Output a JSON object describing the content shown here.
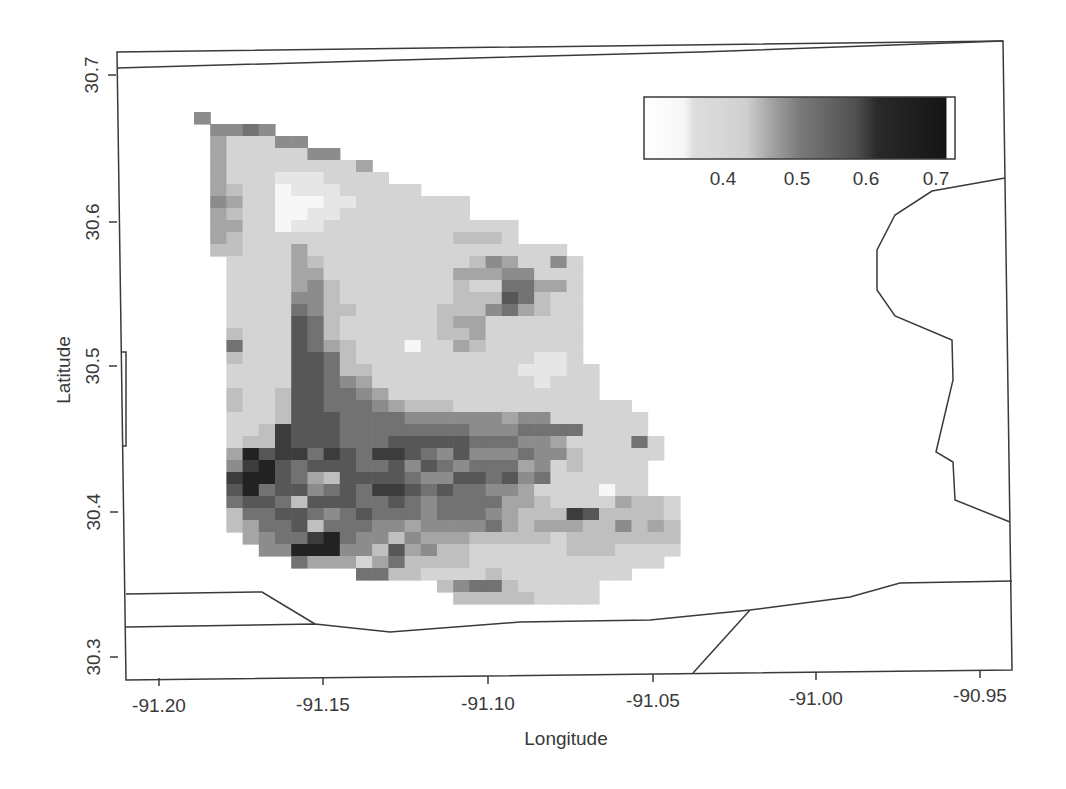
{
  "chart_data": {
    "type": "heatmap",
    "title": "",
    "xlabel": "Longitude",
    "ylabel": "Latitude",
    "xlim": [
      -91.21,
      -90.94
    ],
    "ylim": [
      30.29,
      30.71
    ],
    "x_ticks": [
      "-91.20",
      "-91.15",
      "-91.10",
      "-91.05",
      "-91.00",
      "-90.95"
    ],
    "y_ticks": [
      "30.3",
      "30.4",
      "30.5",
      "30.6",
      "30.7"
    ],
    "grid": false,
    "colorbar": {
      "position": "top-right inset",
      "range": [
        0.33,
        0.72
      ],
      "tick_labels": [
        "0.4",
        "0.5",
        "0.6",
        "0.7"
      ],
      "tick_values": [
        0.4,
        0.5,
        0.6,
        0.7
      ],
      "colormap": "grayscale (white = low, black = high)"
    },
    "value_levels": {
      "0": 0.34,
      "1": 0.38,
      "2": 0.41,
      "3": 0.44,
      "4": 0.48,
      "5": 0.52,
      "6": 0.56,
      "7": 0.6,
      "8": 0.64,
      "9": 0.68
    },
    "grid_origin_px": {
      "x": 194,
      "y": 112,
      "cell_w": 16.2,
      "cell_h": 12
    },
    "rows": [
      "5.......................................",
      ".5565...................................",
      ".422255.................................",
      ".42222255...............................",
      ".4222222224.............................",
      ".42221112222............................",
      ".4322011122222..........................",
      ".5422000112222222.......................",
      ".4322001122222222.......................",
      ".4422011222222222222....................",
      ".4322222222222223332....................",
      ".3322242222222222222222.................",
      "..2222432222222223542252................",
      "..2222442222222244455222................",
      "..2222453222222232266442................",
      "..2222553222222233376322................",
      "..2222653322222333564322................",
      "..2222763222222344222222................",
      "..3222763222222334222222................",
      "..6222764322202243222222................",
      "..3222776322222222222112................",
      "..22227763322222222211122...............",
      "..22227765422222222221222...............",
      "..32237766542222222222222...............",
      "..3223776665433322222222222.............",
      "..22237776666555555455222222............",
      "..22387776666666655566662222............",
      "..233877766677777666554222262...........",
      "..497886876887657555655322222...........",
      "..58976777667576566645232222............",
      "..89976437777655776756222222............",
      "..79677567688767665542222022............",
      "..6776377766765666644322224332..........",
      "..3667765676665666543338733332..........",
      "..3466736665545555643444335343..........",
      "...456689655354443333323333333..........",
      "....55999553745332222223332222..........",
      "......64442463333222222222222...........",
      "..........66332222322222222.............",
      "...............3566322222...............",
      "................333332222..............."
    ],
    "map_boundaries": [
      {
        "name": "top-boundary",
        "points": [
          [
            117,
            68
          ],
          [
            400,
            60
          ],
          [
            700,
            52
          ],
          [
            1003,
            41
          ]
        ]
      },
      {
        "name": "east-boundary",
        "points": [
          [
            1005,
            178
          ],
          [
            932,
            191
          ],
          [
            895,
            215
          ],
          [
            877,
            250
          ],
          [
            877,
            290
          ],
          [
            895,
            316
          ],
          [
            952,
            340
          ],
          [
            953,
            380
          ],
          [
            936,
            452
          ],
          [
            953,
            462
          ],
          [
            955,
            500
          ],
          [
            1010,
            522
          ]
        ]
      },
      {
        "name": "south-boundary-upper",
        "points": [
          [
            126,
            594
          ],
          [
            262,
            592
          ],
          [
            315,
            624
          ]
        ]
      },
      {
        "name": "south-boundary-lower",
        "points": [
          [
            126,
            627
          ],
          [
            315,
            624
          ],
          [
            390,
            632
          ],
          [
            520,
            622
          ],
          [
            650,
            620
          ],
          [
            750,
            610
          ],
          [
            850,
            597
          ],
          [
            900,
            583
          ],
          [
            1012,
            581
          ]
        ]
      },
      {
        "name": "southeast-diagonal",
        "points": [
          [
            750,
            610
          ],
          [
            693,
            673
          ]
        ]
      },
      {
        "name": "west-notch",
        "points": [
          [
            122,
            352
          ],
          [
            126,
            352
          ],
          [
            126,
            446
          ],
          [
            122,
            446
          ]
        ]
      }
    ]
  },
  "axes": {
    "x_title": "Longitude",
    "y_title": "Latitude",
    "x_tick_px": [
      159,
      323,
      488,
      653,
      816,
      980
    ],
    "y_tick_px": [
      657,
      512,
      366,
      222,
      75
    ]
  },
  "colors": {
    "axis": "#3a3a3a",
    "low": "#ffffff",
    "high": "#151515"
  }
}
